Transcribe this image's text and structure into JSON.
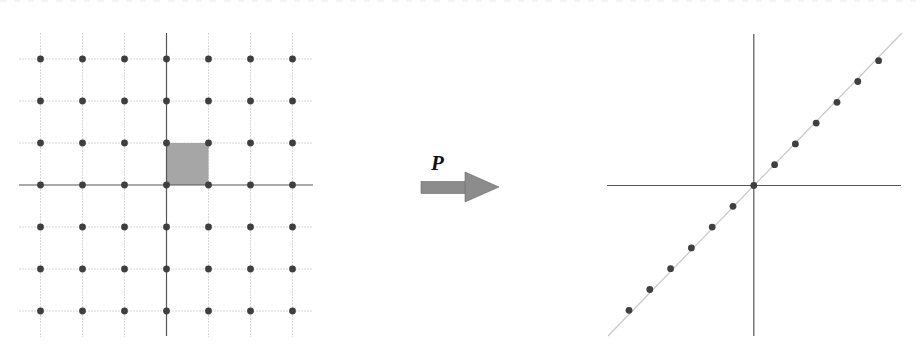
{
  "figure": {
    "width": 920,
    "height": 359,
    "colors": {
      "background": "#ffffff",
      "grid_line": "#d9d9d9",
      "axis_line": "#555555",
      "dot": "#3f3f3f",
      "unit_square": "#a6a6a6",
      "arrow_fill": "#8c8c8c",
      "arrow_stroke": "#6a6a6a",
      "projection_line": "#c8c8c8"
    }
  },
  "left_panel": {
    "name": "integer-lattice",
    "origin": [
      166.5,
      185
    ],
    "spacing": 42,
    "lattice_range": [
      -3,
      3
    ],
    "grid_extent": {
      "x": [
        19,
        313
      ],
      "y": [
        33,
        337
      ]
    },
    "axis_extent": {
      "x": [
        19,
        313
      ],
      "y": [
        33,
        336
      ]
    },
    "dot_radius": 3.4,
    "unit_square": {
      "x0": 0,
      "y0": 0,
      "x1": 1,
      "y1": 1
    }
  },
  "transform": {
    "label": "P",
    "arrow": {
      "shaft": {
        "x0": 421,
        "x1": 466,
        "y0": 181.5,
        "y1": 193.5
      },
      "head": {
        "x0": 465,
        "x1": 499,
        "y_top": 172,
        "y_bottom": 202,
        "y_mid": 187
      }
    },
    "label_pos": {
      "left": 431,
      "top": 153
    }
  },
  "right_panel": {
    "name": "projected-lattice",
    "origin": [
      753.8,
      185.5
    ],
    "dot_step": 20.8,
    "dot_range": [
      -6,
      6
    ],
    "axis_extent": {
      "x": [
        607,
        901
      ],
      "y": [
        34,
        336
      ]
    },
    "projection_line": {
      "x0": 608,
      "y0": 336,
      "x1": 902,
      "y1": 33
    },
    "dot_radius": 3.4
  }
}
